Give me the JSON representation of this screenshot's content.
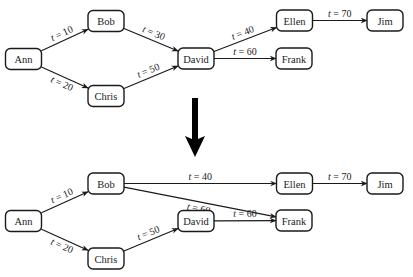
{
  "diagram": {
    "colors": {
      "stroke": "#1a1a1a",
      "text": "#222222",
      "background": "#ffffff",
      "arrow": "#000000"
    },
    "transform_arrow": {
      "direction": "down",
      "meaning": "transforms-to"
    },
    "graphs": [
      {
        "id": "before",
        "nodes": [
          {
            "id": "ann",
            "label": "Ann"
          },
          {
            "id": "bob",
            "label": "Bob"
          },
          {
            "id": "chris",
            "label": "Chris"
          },
          {
            "id": "david",
            "label": "David"
          },
          {
            "id": "ellen",
            "label": "Ellen"
          },
          {
            "id": "frank",
            "label": "Frank"
          },
          {
            "id": "jim",
            "label": "Jim"
          }
        ],
        "edges": [
          {
            "from": "ann",
            "to": "bob",
            "var": "t",
            "op": " = ",
            "value": "10"
          },
          {
            "from": "ann",
            "to": "chris",
            "var": "t",
            "op": " = ",
            "value": "20"
          },
          {
            "from": "bob",
            "to": "david",
            "var": "t",
            "op": " = ",
            "value": "30"
          },
          {
            "from": "chris",
            "to": "david",
            "var": "t",
            "op": " = ",
            "value": "50"
          },
          {
            "from": "david",
            "to": "ellen",
            "var": "t",
            "op": " = ",
            "value": "40"
          },
          {
            "from": "david",
            "to": "frank",
            "var": "t",
            "op": " = ",
            "value": "60"
          },
          {
            "from": "ellen",
            "to": "jim",
            "var": "t",
            "op": " = ",
            "value": "70"
          }
        ]
      },
      {
        "id": "after",
        "nodes": [
          {
            "id": "ann",
            "label": "Ann"
          },
          {
            "id": "bob",
            "label": "Bob"
          },
          {
            "id": "chris",
            "label": "Chris"
          },
          {
            "id": "david",
            "label": "David"
          },
          {
            "id": "ellen",
            "label": "Ellen"
          },
          {
            "id": "frank",
            "label": "Frank"
          },
          {
            "id": "jim",
            "label": "Jim"
          }
        ],
        "edges": [
          {
            "from": "ann",
            "to": "bob",
            "var": "t",
            "op": " = ",
            "value": "10"
          },
          {
            "from": "ann",
            "to": "chris",
            "var": "t",
            "op": " = ",
            "value": "20"
          },
          {
            "from": "bob",
            "to": "ellen",
            "var": "t",
            "op": " = ",
            "value": "40"
          },
          {
            "from": "bob",
            "to": "frank",
            "var": "t",
            "op": " = ",
            "value": "60"
          },
          {
            "from": "chris",
            "to": "david",
            "var": "t",
            "op": " = ",
            "value": "50"
          },
          {
            "from": "david",
            "to": "frank",
            "var": "t",
            "op": " = ",
            "value": "60"
          },
          {
            "from": "ellen",
            "to": "jim",
            "var": "t",
            "op": " = ",
            "value": "70"
          }
        ]
      }
    ]
  }
}
